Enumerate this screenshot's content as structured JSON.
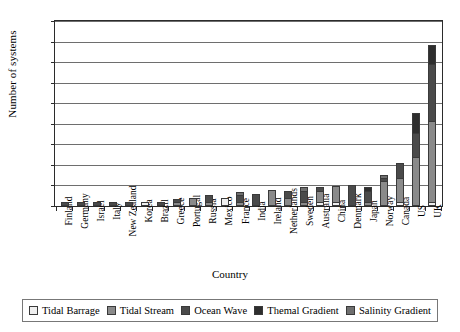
{
  "chart_data": {
    "type": "bar",
    "stacked": true,
    "title": "",
    "xlabel": "Country",
    "ylabel": "Number of systems",
    "ylim": [
      0,
      45
    ],
    "ytick_step": 5,
    "yticks": [
      0,
      5,
      10,
      15,
      20,
      25,
      30,
      35,
      40,
      45
    ],
    "grid": true,
    "legend_position": "bottom",
    "categories": [
      "Finland",
      "Germany",
      "Israel",
      "Italy",
      "New Zealand",
      "Korea",
      "Brazil",
      "Greece",
      "Portugal",
      "Russia",
      "Mexico",
      "France",
      "India",
      "Ireland",
      "Netherlands",
      "Sweden",
      "Australia",
      "China",
      "Denmark",
      "Japan",
      "Norway",
      "Canada",
      "US",
      "UK"
    ],
    "series": [
      {
        "name": "Tidal Barrage",
        "color": "#efefef",
        "values": [
          0,
          0,
          0,
          0,
          0,
          1,
          0,
          0,
          0,
          0,
          2,
          0,
          0,
          0,
          0,
          0,
          1,
          1,
          0,
          0,
          0,
          1,
          0,
          1
        ]
      },
      {
        "name": "Tidal Stream",
        "color": "#8a8a8a",
        "values": [
          0,
          0,
          0,
          0,
          0,
          0,
          0,
          1,
          2,
          1,
          0,
          1,
          0,
          4,
          2,
          1,
          3,
          4,
          0,
          1,
          6,
          6,
          12,
          20
        ]
      },
      {
        "name": "Ocean Wave",
        "color": "#4a4a4a",
        "values": [
          1,
          1,
          1,
          1,
          1,
          0,
          1,
          1,
          0,
          2,
          0,
          2,
          3,
          0,
          2,
          3,
          1,
          0,
          5,
          3,
          1,
          4,
          6,
          14
        ]
      },
      {
        "name": "Themal Gradient",
        "color": "#2e2e2e",
        "values": [
          0,
          0,
          0,
          0,
          0,
          0,
          0,
          0,
          0,
          0,
          0,
          0,
          0,
          0,
          0,
          0,
          0,
          0,
          0,
          1,
          0,
          0,
          5,
          5
        ]
      },
      {
        "name": "Salinity Gradient",
        "color": "#6f6f6f",
        "values": [
          0,
          0,
          0,
          0,
          0,
          0,
          0,
          0,
          0,
          0,
          0,
          1,
          0,
          0,
          0,
          1,
          0,
          0,
          0,
          0,
          1,
          0,
          0,
          0
        ]
      }
    ],
    "totals": [
      1,
      1,
      1,
      1,
      1,
      1,
      1,
      2,
      2,
      3,
      2,
      4,
      3,
      4,
      4,
      5,
      5,
      5,
      5,
      5,
      8,
      11,
      23,
      40
    ]
  },
  "legend": {
    "items": [
      {
        "label": "Tidal Barrage",
        "color": "#efefef"
      },
      {
        "label": "Tidal Stream",
        "color": "#8a8a8a"
      },
      {
        "label": "Ocean Wave",
        "color": "#4a4a4a"
      },
      {
        "label": "Themal Gradient",
        "color": "#2e2e2e"
      },
      {
        "label": "Salinity Gradient",
        "color": "#6f6f6f"
      }
    ]
  },
  "axes": {
    "y_title": "Number of systems",
    "x_title": "Country"
  }
}
